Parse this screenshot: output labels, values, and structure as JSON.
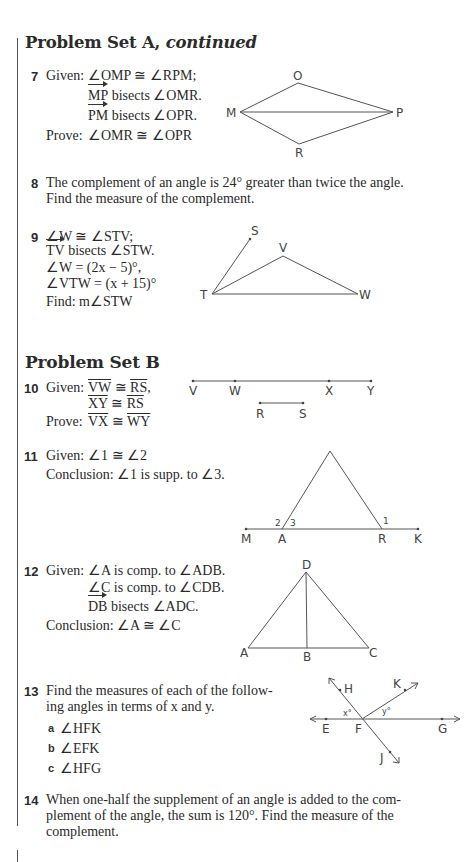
{
  "sections": [
    {
      "heading": "Problem Set A,",
      "heading_italic": "continued"
    },
    {
      "heading": "Problem Set B"
    }
  ],
  "problems": {
    "p7": {
      "number": "7",
      "given_label": "Given:",
      "given": [
        "∠OMP ≅ ∠RPM;",
        " bisects ∠OMR.",
        " bisects ∠OPR."
      ],
      "rays": [
        "MP",
        "PM"
      ],
      "prove_label": "Prove:",
      "prove": "∠OMR ≅ ∠OPR",
      "diagram_labels": {
        "O": "O",
        "M": "M",
        "P": "P",
        "R": "R"
      }
    },
    "p8": {
      "number": "8",
      "text_lines": [
        "The complement of an angle is 24° greater than twice the angle.",
        "Find the measure of the complement."
      ]
    },
    "p9": {
      "number": "9",
      "lines": [
        "∠W ≅ ∠STV;",
        " bisects ∠STW.",
        "∠W = (2x − 5)°,",
        "∠VTW = (x + 15)°",
        "Find: m∠STW"
      ],
      "ray": "TV",
      "diagram_labels": {
        "S": "S",
        "V": "V",
        "T": "T",
        "W": "W"
      }
    },
    "p10": {
      "number": "10",
      "given_label": "Given:",
      "given": [
        [
          "VW",
          " ≅ ",
          "RS",
          ","
        ],
        [
          "XY",
          " ≅ ",
          "RS",
          ""
        ]
      ],
      "prove_label": "Prove:",
      "prove": [
        "VX",
        " ≅ ",
        "WY"
      ],
      "diagram_labels": {
        "V": "V",
        "W": "W",
        "X": "X",
        "Y": "Y",
        "R": "R",
        "S": "S"
      }
    },
    "p11": {
      "number": "11",
      "given_label": "Given:",
      "given": "∠1 ≅ ∠2",
      "conclusion_label": "Conclusion:",
      "conclusion": "∠1 is supp. to ∠3.",
      "diagram_labels": {
        "M": "M",
        "A": "A",
        "R": "R",
        "K": "K",
        "a1": "1",
        "a2": "2",
        "a3": "3"
      }
    },
    "p12": {
      "number": "12",
      "given_label": "Given:",
      "given": [
        "∠A is comp. to ∠ADB.",
        "∠C is comp. to ∠CDB.",
        " bisects ∠ADC."
      ],
      "ray": "DB",
      "conclusion_label": "Conclusion:",
      "conclusion": "∠A ≅ ∠C",
      "diagram_labels": {
        "D": "D",
        "A": "A",
        "B": "B",
        "C": "C"
      }
    },
    "p13": {
      "number": "13",
      "text_lines": [
        "Find the measures of each of the follow-",
        "ing angles in terms of x and y."
      ],
      "parts": [
        {
          "letter": "a",
          "text": "∠HFK"
        },
        {
          "letter": "b",
          "text": "∠EFK"
        },
        {
          "letter": "c",
          "text": "∠HFG"
        }
      ],
      "diagram_labels": {
        "H": "H",
        "K": "K",
        "E": "E",
        "F": "F",
        "G": "G",
        "J": "J",
        "x": "x°",
        "y": "y°"
      }
    },
    "p14": {
      "number": "14",
      "text_lines": [
        "When one-half the supplement of an angle is added to the com-",
        "plement of the angle, the sum is 120°. Find the measure of the",
        "complement."
      ]
    }
  }
}
